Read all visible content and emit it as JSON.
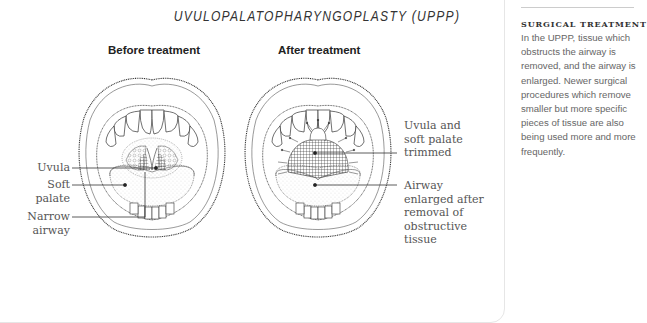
{
  "figure": {
    "title": "UVULOPALATOPHARYNGOPLASTY (UPPP)",
    "panels": [
      {
        "heading": "Before treatment",
        "labels": [
          {
            "id": "uvula",
            "text": "Uvula"
          },
          {
            "id": "soft-palate",
            "text": "Soft\npalate"
          },
          {
            "id": "narrow-airway",
            "text": "Narrow\nairway"
          }
        ]
      },
      {
        "heading": "After treatment",
        "labels": [
          {
            "id": "uvula-trimmed",
            "text": "Uvula and\nsoft palate\ntrimmed"
          },
          {
            "id": "airway-enlarged",
            "text": "Airway\nenlarged after\nremoval of\nobstructive\ntissue"
          }
        ]
      }
    ]
  },
  "sidebar": {
    "heading": "SURGICAL TREATMENT",
    "body": "In the UPPP, tissue which obstructs the airway is removed, and the airway is enlarged. Newer surgical procedures which remove smaller but more specific pieces of tissue are also being used more and more frequently."
  },
  "colors": {
    "line": "#333333",
    "text": "#555555",
    "rule": "#cccccc"
  }
}
